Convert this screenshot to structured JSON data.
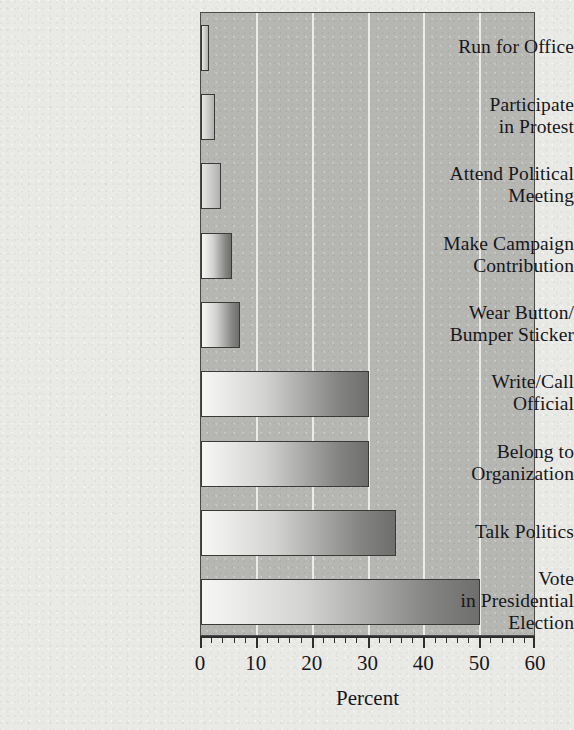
{
  "chart_data": {
    "type": "bar",
    "orientation": "horizontal",
    "title": "",
    "xlabel": "Percent",
    "ylabel": "",
    "xlim": [
      0,
      60
    ],
    "xticks": [
      0,
      10,
      20,
      30,
      40,
      50,
      60
    ],
    "xtick_labels": [
      "0",
      "10",
      "20",
      "30",
      "40",
      "50",
      "60"
    ],
    "minor_tick_interval": 2,
    "grid": "vertical gridlines at 10, 20, 30, 40, 50",
    "legend": null,
    "categories": [
      "Run for Office",
      "Participate in Protest",
      "Attend Political Meeting",
      "Make Campaign Contribution",
      "Wear Button/Bumper Sticker",
      "Write/Call Official",
      "Belong to Organization",
      "Talk Politics",
      "Vote in Presidential Election"
    ],
    "category_lines": [
      [
        "Run for Office"
      ],
      [
        "Participate",
        "in Protest"
      ],
      [
        "Attend Political",
        "Meeting"
      ],
      [
        "Make Campaign",
        "Contribution"
      ],
      [
        "Wear Button/",
        "Bumper Sticker"
      ],
      [
        "Write/Call",
        "Official"
      ],
      [
        "Belong to",
        "Organization"
      ],
      [
        "Talk Politics"
      ],
      [
        "Vote",
        "in Presidential",
        "Election"
      ]
    ],
    "values": [
      1.5,
      2.5,
      3.5,
      5.5,
      7,
      30,
      30,
      35,
      50
    ],
    "colors": {
      "figure_background": "#e9e9e6",
      "plot_background": "#b6b6b3",
      "gridline": "#f0f0ee",
      "bar_gradient_start": "#f6f6f4",
      "bar_gradient_end": "#6e6e6c",
      "bar_border": "#3a3a3a",
      "axis": "#2e2e2e",
      "text": "#17171a"
    }
  },
  "axis": {
    "xlabel": "Percent"
  }
}
